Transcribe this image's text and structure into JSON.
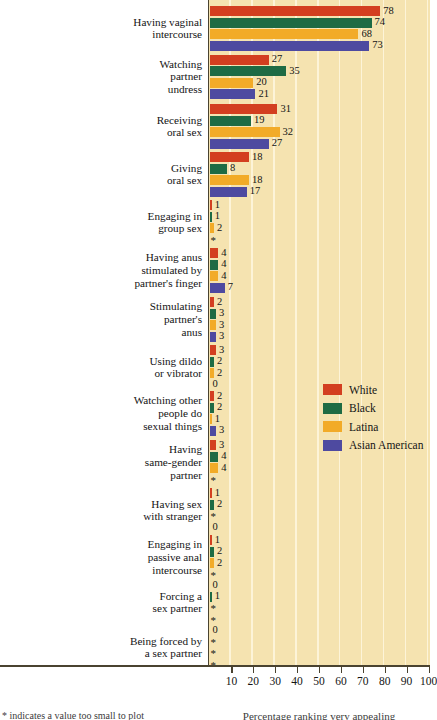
{
  "chart_data": {
    "type": "bar",
    "orientation": "horizontal",
    "title": "",
    "xlabel": "Percentage ranking very appealing",
    "ylabel": "",
    "xlim": [
      0,
      100
    ],
    "xticks": [
      10,
      20,
      30,
      40,
      50,
      60,
      70,
      80,
      90,
      100
    ],
    "grid": true,
    "legend_position": "right-middle",
    "note": "* indicates a value too small to plot",
    "series": [
      {
        "name": "White",
        "color": "#d33f20"
      },
      {
        "name": "Black",
        "color": "#1e6b44"
      },
      {
        "name": "Latina",
        "color": "#f2ab28"
      },
      {
        "name": "Asian American",
        "color": "#4e4aa0"
      }
    ],
    "categories": [
      {
        "label": "Having vaginal\nintercourse",
        "values": [
          78,
          74,
          68,
          73
        ],
        "display": [
          "78",
          "74",
          "68",
          "73"
        ]
      },
      {
        "label": "Watching\npartner\nundress",
        "values": [
          27,
          35,
          20,
          21
        ],
        "display": [
          "27",
          "35",
          "20",
          "21"
        ]
      },
      {
        "label": "Receiving\noral sex",
        "values": [
          31,
          19,
          32,
          27
        ],
        "display": [
          "31",
          "19",
          "32",
          "27"
        ]
      },
      {
        "label": "Giving\noral sex",
        "values": [
          18,
          8,
          18,
          17
        ],
        "display": [
          "18",
          "8",
          "18",
          "17"
        ]
      },
      {
        "label": "Engaging in\ngroup sex",
        "values": [
          1,
          1,
          2,
          0
        ],
        "display": [
          "1",
          "1",
          "2",
          "*"
        ]
      },
      {
        "label": "Having anus\nstimulated by\npartner's finger",
        "values": [
          4,
          4,
          4,
          7
        ],
        "display": [
          "4",
          "4",
          "4",
          "7"
        ]
      },
      {
        "label": "Stimulating\npartner's\nanus",
        "values": [
          2,
          3,
          3,
          3
        ],
        "display": [
          "2",
          "3",
          "3",
          "3"
        ]
      },
      {
        "label": "Using dildo\nor vibrator",
        "values": [
          3,
          2,
          2,
          0
        ],
        "display": [
          "3",
          "2",
          "2",
          "0"
        ]
      },
      {
        "label": "Watching other\npeople do\nsexual things",
        "values": [
          2,
          2,
          1,
          3
        ],
        "display": [
          "2",
          "2",
          "1",
          "3"
        ]
      },
      {
        "label": "Having\nsame-gender\npartner",
        "values": [
          3,
          4,
          4,
          0
        ],
        "display": [
          "3",
          "4",
          "4",
          "*"
        ]
      },
      {
        "label": "Having sex\nwith stranger",
        "values": [
          1,
          2,
          0,
          0
        ],
        "display": [
          "1",
          "2",
          "*",
          "0"
        ]
      },
      {
        "label": "Engaging in\npassive anal\nintercourse",
        "values": [
          1,
          2,
          2,
          0
        ],
        "display": [
          "1",
          "2",
          "2",
          "*"
        ]
      },
      {
        "label": "Forcing a\nsex partner",
        "values": [
          0,
          1,
          0,
          0
        ],
        "display": [
          "0",
          "1",
          "*",
          "*"
        ]
      },
      {
        "label": "Being forced by\na sex partner",
        "values": [
          0,
          0,
          0,
          0
        ],
        "display": [
          "0",
          "*",
          "*",
          "*"
        ]
      }
    ]
  },
  "colors": {
    "plot_background": "#f5e3b0",
    "gridline": "#fdf4d8",
    "axis": "#4a4330",
    "text": "#141414"
  }
}
